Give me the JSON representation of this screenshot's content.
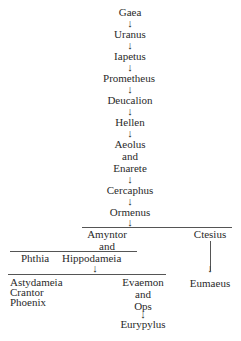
{
  "header_fragment": "...",
  "lineage": [
    {
      "name": "Gaea"
    },
    {
      "name": "Uranus"
    },
    {
      "name": "Iapetus"
    },
    {
      "name": "Prometheus"
    },
    {
      "name": "Deucalion"
    },
    {
      "name": "Hellen"
    },
    {
      "name": "Aeolus"
    },
    {
      "name": "and"
    },
    {
      "name": "Enarete"
    },
    {
      "name": "Cercaphus"
    },
    {
      "name": "Ormenus"
    }
  ],
  "branches": {
    "amyntor": "Amyntor",
    "and": "and",
    "phthia": "Phthia",
    "hippodameia": "Hippodameia",
    "ctesius": "Ctesius",
    "eumaeus": "Eumaeus"
  },
  "children_of_amyntor": [
    "Astydameia",
    "Crantor",
    "Phoenix"
  ],
  "evaemon_branch": {
    "evaemon": "Evaemon",
    "and": "and",
    "ops": "Ops",
    "eurypylus": "Eurypylus"
  },
  "arrow_glyph": "↓"
}
